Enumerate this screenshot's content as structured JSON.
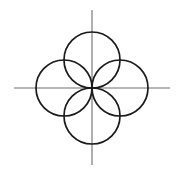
{
  "figure": {
    "canvas": {
      "width": 184,
      "height": 169,
      "background_color": "#ffffff"
    },
    "origin": {
      "label": "origin",
      "x": 92,
      "y": 88
    },
    "axes": {
      "color": "#6e6e6e",
      "stroke_width": 1.1,
      "horizontal": {
        "name": "horizontal-axis",
        "x1": 14,
        "y1": 88,
        "x2": 170,
        "y2": 88
      },
      "vertical": {
        "name": "vertical-axis",
        "x1": 92,
        "y1": 10,
        "x2": 92,
        "y2": 165
      }
    },
    "circles": {
      "color": "#1a1a1a",
      "stroke_width": 1.7,
      "fill": "none",
      "radius": 28,
      "items": [
        {
          "name": "top-circle",
          "position": "top",
          "cx": 92,
          "cy": 60,
          "r": 28
        },
        {
          "name": "left-circle",
          "position": "left",
          "cx": 64,
          "cy": 88,
          "r": 28
        },
        {
          "name": "right-circle",
          "position": "right",
          "cx": 120,
          "cy": 88,
          "r": 28
        },
        {
          "name": "bottom-circle",
          "position": "bottom",
          "cx": 92,
          "cy": 116,
          "r": 28
        }
      ]
    }
  }
}
